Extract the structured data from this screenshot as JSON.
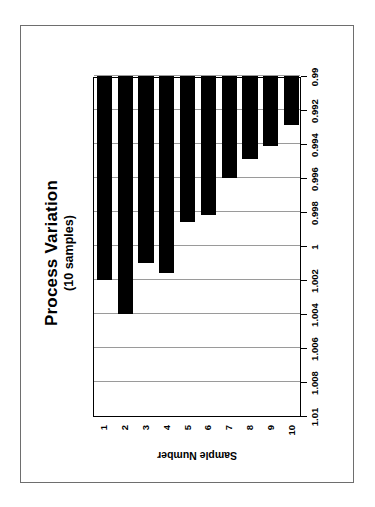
{
  "page": {
    "background_color": "#ffffff",
    "frame_color": "#6e6e6e"
  },
  "chart_data": {
    "type": "bar",
    "orientation": "vertical-rendered-rotated",
    "title": "Process Variation",
    "subtitle": "(10 samples)",
    "xlabel": "Sample Number",
    "ylabel": "",
    "categories": [
      "1",
      "2",
      "3",
      "4",
      "5",
      "6",
      "7",
      "8",
      "9",
      "10"
    ],
    "values": [
      1.002,
      1.004,
      1.001,
      1.0016,
      0.9986,
      0.9982,
      0.996,
      0.9949,
      0.9941,
      0.9929
    ],
    "ylim": [
      0.99,
      1.01
    ],
    "ytick_labels": [
      "1.01",
      "1.008",
      "1.006",
      "1.004",
      "1.002",
      "1",
      "0.998",
      "0.996",
      "0.994",
      "0.992",
      "0.99"
    ],
    "ytick_values": [
      1.01,
      1.008,
      1.006,
      1.004,
      1.002,
      1.0,
      0.998,
      0.996,
      0.994,
      0.992,
      0.99
    ],
    "grid": true,
    "legend": false,
    "bar_color": "#000000",
    "gridline_color": "#9a9a9a",
    "axis_color": "#000000"
  }
}
